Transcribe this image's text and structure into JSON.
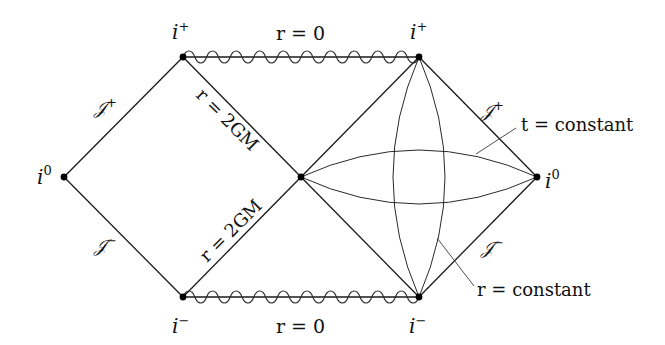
{
  "diagram": {
    "type": "penrose-diagram",
    "vertices": [
      {
        "id": "i0-left",
        "label": "i",
        "sup": "0",
        "x": 64,
        "y": 177
      },
      {
        "id": "iplus-left",
        "label": "i",
        "sup": "+",
        "x": 183,
        "y": 57
      },
      {
        "id": "center",
        "label": "",
        "sup": "",
        "x": 301,
        "y": 177
      },
      {
        "id": "iplus-right",
        "label": "i",
        "sup": "+",
        "x": 419,
        "y": 57
      },
      {
        "id": "i0-right",
        "label": "i",
        "sup": "0",
        "x": 537,
        "y": 177
      },
      {
        "id": "iminus-left",
        "label": "i",
        "sup": "−",
        "x": 183,
        "y": 297
      },
      {
        "id": "iminus-right",
        "label": "i",
        "sup": "−",
        "x": 419,
        "y": 297
      }
    ],
    "labels": {
      "iplus_left": {
        "base": "i",
        "sup": "+"
      },
      "iplus_right": {
        "base": "i",
        "sup": "+"
      },
      "iminus_left": {
        "base": "i",
        "sup": "−"
      },
      "iminus_right": {
        "base": "i",
        "sup": "−"
      },
      "i0_left": {
        "base": "i",
        "sup": "0"
      },
      "i0_right": {
        "base": "i",
        "sup": "0"
      },
      "scri_plus_left": {
        "base": "𝒥",
        "sup": "+"
      },
      "scri_minus_left": {
        "base": "𝒥",
        "sup": "−"
      },
      "scri_plus_right": {
        "base": "𝒥",
        "sup": "+"
      },
      "scri_minus_right": {
        "base": "𝒥",
        "sup": "−"
      },
      "singularity_top": "r = 0",
      "singularity_bottom": "r = 0",
      "horizon_upper": "r = 2GM",
      "horizon_lower": "r = 2GM",
      "t_constant": "t = constant",
      "r_constant": "r = constant"
    },
    "colors": {
      "line": "#1a1a1a",
      "background": "#ffffff",
      "vertex": "#000000"
    }
  }
}
